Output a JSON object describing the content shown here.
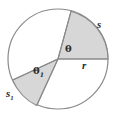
{
  "figure": {
    "type": "circle-sector-diagram",
    "colors": {
      "shaded_fill": "#d7d7d7",
      "unshaded_fill": "#ffffff",
      "stroke": "#8a8a8a",
      "label_text": "#2b2b2b",
      "background": "#ffffff"
    },
    "geometry": {
      "center_x": 58,
      "center_y": 59,
      "radius": 50,
      "radii_angles_deg": [
        0,
        75,
        205
      ],
      "shaded_sectors": [
        {
          "name": "s-sector",
          "start_deg": 0,
          "end_deg": 75
        },
        {
          "name": "s1-sector",
          "start_deg": 180,
          "end_deg": 205
        }
      ]
    },
    "labels": {
      "arc_s": "s",
      "arc_s1_base": "s",
      "arc_s1_sub": "1",
      "radius_r": "r",
      "angle_theta": "θ",
      "angle_theta1_base": "θ",
      "angle_theta1_sub": "1"
    }
  }
}
